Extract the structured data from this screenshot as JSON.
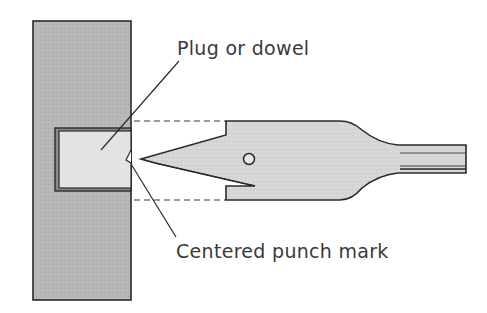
{
  "diagram": {
    "type": "technical-illustration",
    "labels": {
      "plug": "Plug or dowel",
      "punch_mark": "Centered punch mark"
    },
    "colors": {
      "board_fill": "#b5b5b5",
      "plug_fill": "#e2e2e2",
      "bit_fill": "#d4d4d4",
      "outline": "#2a2a2a",
      "text": "#3a3a3a"
    }
  }
}
